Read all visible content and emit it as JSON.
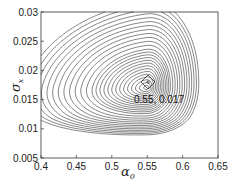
{
  "chart_data": {
    "type": "contour",
    "title": "",
    "xlabel": "α0",
    "ylabel": "σx",
    "xlim": [
      0.4,
      0.65
    ],
    "ylim": [
      0.005,
      0.03
    ],
    "x_ticks": [
      "0.4",
      "0.45",
      "0.5",
      "0.55",
      "0.6",
      "0.65"
    ],
    "y_ticks": [
      "0.005",
      "0.01",
      "0.015",
      "0.02",
      "0.025",
      "0.03"
    ],
    "grid": false,
    "legend": null,
    "optimum": {
      "x": 0.55,
      "y": 0.017,
      "marker": "plus-in-diamond"
    },
    "annotations": [
      {
        "text": "0.55, 0.017",
        "x": 0.55,
        "y": 0.0155
      }
    ]
  },
  "labels": {
    "xlabel_main": "α",
    "xlabel_sub": "0",
    "ylabel_main": "σ",
    "ylabel_sub": "x",
    "annotation": "0.55, 0.017"
  }
}
